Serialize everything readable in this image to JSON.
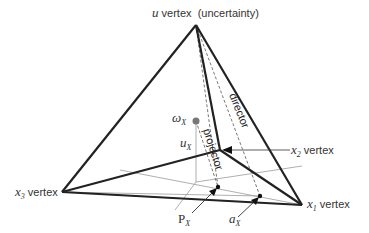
{
  "diagram": {
    "vertices": {
      "u": {
        "var": "u",
        "text": "vertex",
        "note": "(uncertainty)",
        "x": 196,
        "y": 25
      },
      "x1": {
        "var": "x",
        "sub": "1",
        "text": "vertex",
        "x": 302,
        "y": 205
      },
      "x2": {
        "var": "x",
        "sub": "2",
        "text": "vertex",
        "x": 220,
        "y": 150
      },
      "x3": {
        "var": "x",
        "sub": "3",
        "text": "vertex",
        "x": 62,
        "y": 192
      }
    },
    "lines": {
      "director": "director",
      "projector": "projector"
    },
    "points": {
      "omega": {
        "sym": "ω",
        "sub": "X"
      },
      "u": {
        "sym": "u",
        "sub": "X"
      },
      "P": {
        "sym": "P",
        "sub": "X"
      },
      "a": {
        "sym": "a",
        "sub": "X"
      }
    },
    "colors": {
      "edge": "#222222",
      "thin": "#888888",
      "point": "#666666"
    }
  }
}
